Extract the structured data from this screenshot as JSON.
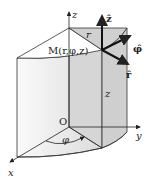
{
  "diagram": {
    "labels": {
      "z_axis": "z",
      "y_axis": "y",
      "x_axis": "x",
      "origin": "O",
      "point": "M(r,φ,z)",
      "radius": "r",
      "height": "z",
      "angle": "φ",
      "unit_z": "ẑ",
      "unit_phi": "φ̂",
      "unit_r": "r̂"
    }
  }
}
